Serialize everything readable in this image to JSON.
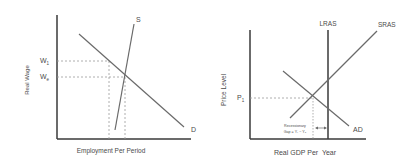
{
  "left_diagram": {
    "title": "Labor Market",
    "y_axis_label": "Real Wage",
    "x_axis_label": "Employment Per Period",
    "curves": {
      "supply": "S",
      "demand": "D"
    },
    "price_levels": {
      "w1": "W",
      "w1_sub": "1",
      "we": "W",
      "we_sub": "e"
    }
  },
  "right_diagram": {
    "title": "Aggregate Demand and Supply",
    "y_axis_label": "Price Level",
    "x_axis_label": "Real GDP Per  Year",
    "curves": {
      "lras": "LRAS",
      "sras": "SRAS",
      "ad": "AD"
    },
    "price_levels": {
      "p1": "P",
      "p1_sub": "1"
    },
    "annotation": {
      "line1": "Recessionary",
      "line2": "Gap = Y₁ − Y₀"
    }
  },
  "colors": {
    "axis": "#3a3a3a",
    "curve": "#6a6a6a",
    "dashed": "#9a9a9a",
    "text": "#4a4a4a"
  }
}
